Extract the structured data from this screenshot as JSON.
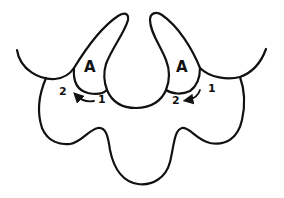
{
  "diagram": {
    "colors": {
      "stroke": "#111111",
      "background": "#ffffff"
    },
    "labels": {
      "left_region": "A",
      "right_region": "A",
      "left_start": "1",
      "left_end": "2",
      "right_start": "1",
      "right_end": "2"
    },
    "arrows": [
      {
        "side": "left",
        "from": "1",
        "to": "2",
        "direction": "right-to-left"
      },
      {
        "side": "right",
        "from": "1",
        "to": "2",
        "direction": "top-right-to-bottom-left"
      }
    ]
  }
}
